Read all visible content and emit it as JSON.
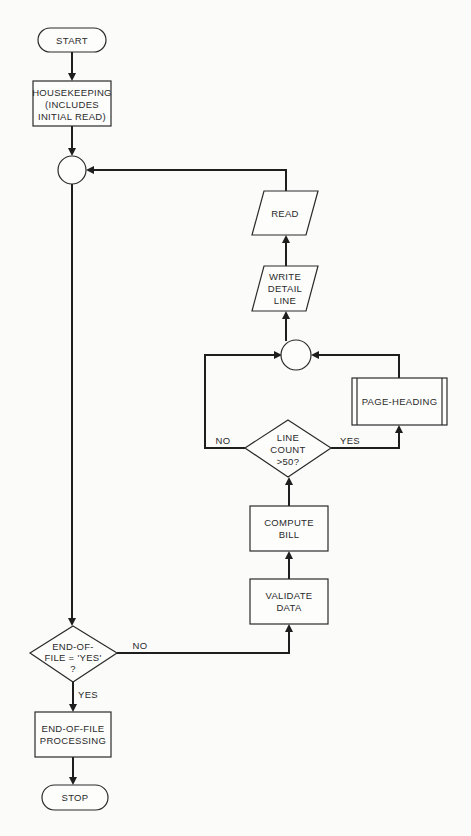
{
  "diagram": {
    "type": "flowchart",
    "nodes": {
      "start": {
        "shape": "terminator",
        "label": "START"
      },
      "housekeeping": {
        "shape": "process",
        "lines": [
          "HOUSEKEEPING",
          "(INCLUDES",
          "INITIAL READ)"
        ]
      },
      "connector_main": {
        "shape": "connector"
      },
      "eof_decision": {
        "shape": "decision",
        "lines": [
          "END-OF-",
          "FILE = 'YES'",
          "?"
        ]
      },
      "validate": {
        "shape": "process",
        "lines": [
          "VALIDATE",
          "DATA"
        ]
      },
      "compute": {
        "shape": "process",
        "lines": [
          "COMPUTE",
          "BILL"
        ]
      },
      "line_count": {
        "shape": "decision",
        "lines": [
          "LINE",
          "COUNT",
          ">50?"
        ]
      },
      "page_heading": {
        "shape": "predefined-process",
        "label": "PAGE-HEADING"
      },
      "connector_inner": {
        "shape": "connector"
      },
      "write_detail": {
        "shape": "io",
        "lines": [
          "WRITE",
          "DETAIL",
          "LINE"
        ]
      },
      "read": {
        "shape": "io",
        "label": "READ"
      },
      "eof_processing": {
        "shape": "process",
        "lines": [
          "END-OF-FILE",
          "PROCESSING"
        ]
      },
      "stop": {
        "shape": "terminator",
        "label": "STOP"
      }
    },
    "edge_labels": {
      "eof_no": "NO",
      "eof_yes": "YES",
      "line_count_no": "NO",
      "line_count_yes": "YES"
    },
    "edges": [
      [
        "start",
        "housekeeping"
      ],
      [
        "housekeeping",
        "connector_main"
      ],
      [
        "connector_main",
        "eof_decision"
      ],
      [
        "eof_decision",
        "validate",
        "NO"
      ],
      [
        "eof_decision",
        "eof_processing",
        "YES"
      ],
      [
        "validate",
        "compute"
      ],
      [
        "compute",
        "line_count"
      ],
      [
        "line_count",
        "connector_inner",
        "NO"
      ],
      [
        "line_count",
        "page_heading",
        "YES"
      ],
      [
        "page_heading",
        "connector_inner"
      ],
      [
        "connector_inner",
        "write_detail"
      ],
      [
        "write_detail",
        "read"
      ],
      [
        "read",
        "connector_main"
      ],
      [
        "eof_processing",
        "stop"
      ]
    ]
  },
  "colors": {
    "ink": "#1e1e1e",
    "paper": "#fbfbfa"
  }
}
